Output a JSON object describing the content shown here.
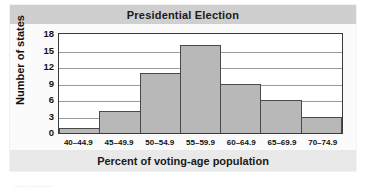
{
  "chart_data": {
    "type": "bar",
    "title": "Presidential Election",
    "xlabel": "Percent of voting-age population",
    "ylabel": "Number of states",
    "categories": [
      "40–44.9",
      "45–49.9",
      "50–54.9",
      "55–59.9",
      "60–64.9",
      "65–69.9",
      "70–74.9"
    ],
    "values": [
      1,
      4,
      11,
      16,
      9,
      6,
      3
    ],
    "ylim": [
      0,
      18
    ],
    "ytick_values": [
      0,
      3,
      6,
      9,
      12,
      15,
      18
    ],
    "ytick_labels": [
      "0",
      "3",
      "6",
      "9",
      "12",
      "15",
      "18"
    ],
    "grid": "horizontal",
    "legend": "none",
    "bar_color": "#b8b8b8",
    "bar_edge_color": "#4a4a4a",
    "title_band_color": "#cfcfcf",
    "gridline_color": "#9a9a9a"
  },
  "artifact": {
    "bottom_text": "— ———"
  }
}
